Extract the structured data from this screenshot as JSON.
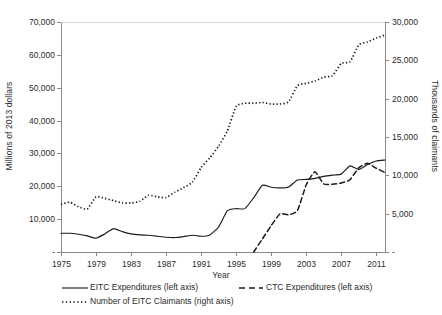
{
  "chart_data": {
    "type": "line",
    "title": "",
    "xlabel": "Year",
    "ylabel": "Millions of 2013 dollars",
    "ylabel_right": "Thousands of claimants",
    "xlim": [
      1975,
      2012
    ],
    "ylim": [
      0,
      70000
    ],
    "ylim_right": [
      0,
      30000
    ],
    "grid": false,
    "legend_position": "below",
    "x_tick_labels": [
      "1975",
      "1979",
      "1983",
      "1987",
      "1991",
      "1995",
      "1999",
      "2003",
      "2007",
      "2011"
    ],
    "x_ticks": [
      1975,
      1979,
      1983,
      1987,
      1991,
      1995,
      1999,
      2003,
      2007,
      2011
    ],
    "y_tick_labels": [
      "-",
      "10,000",
      "20,000",
      "30,000",
      "40,000",
      "50,000",
      "60,000",
      "70,000"
    ],
    "y_ticks": [
      0,
      10000,
      20000,
      30000,
      40000,
      50000,
      60000,
      70000
    ],
    "y_right_tick_labels": [
      "-",
      "5,000",
      "10,000",
      "15,000",
      "20,000",
      "25,000",
      "30,000"
    ],
    "y_right_ticks": [
      0,
      5000,
      10000,
      15000,
      20000,
      25000,
      30000
    ],
    "x": [
      1975,
      1976,
      1977,
      1978,
      1979,
      1980,
      1981,
      1982,
      1983,
      1984,
      1985,
      1986,
      1987,
      1988,
      1989,
      1990,
      1991,
      1992,
      1993,
      1994,
      1995,
      1996,
      1997,
      1998,
      1999,
      2000,
      2001,
      2002,
      2003,
      2004,
      2005,
      2006,
      2007,
      2008,
      2009,
      2010,
      2011,
      2012
    ],
    "series": [
      {
        "name": "EITC Expenditures (left axis)",
        "axis": "left",
        "style": "solid",
        "color": "#1a1a1a",
        "values": [
          5700,
          5700,
          5400,
          4900,
          4200,
          5500,
          7100,
          6200,
          5500,
          5200,
          5100,
          4800,
          4500,
          4400,
          4700,
          5100,
          4800,
          5200,
          7600,
          12600,
          13200,
          13200,
          16500,
          20300,
          19700,
          19500,
          19800,
          21900,
          22100,
          22400,
          23000,
          23400,
          23700,
          26200,
          25100,
          26600,
          27700,
          28000
        ]
      },
      {
        "name": "CTC Expenditures (left axis)",
        "axis": "left",
        "style": "dashed",
        "color": "#1a1a1a",
        "values": [
          null,
          null,
          null,
          null,
          null,
          null,
          null,
          null,
          null,
          null,
          null,
          null,
          null,
          null,
          null,
          null,
          null,
          null,
          null,
          null,
          null,
          null,
          0,
          4000,
          8000,
          11600,
          11300,
          12600,
          20400,
          24400,
          20700,
          20600,
          21000,
          22000,
          25600,
          27000,
          25500,
          24200
        ]
      },
      {
        "name": "Number of EITC Claimants (right axis)",
        "axis": "right",
        "style": "dotted",
        "color": "#1a1a1a",
        "values": [
          6200,
          6500,
          5900,
          5600,
          7200,
          7000,
          6700,
          6400,
          6400,
          6600,
          7400,
          7200,
          7100,
          7800,
          8400,
          9100,
          11000,
          12300,
          13800,
          15800,
          19000,
          19400,
          19400,
          19500,
          19300,
          19300,
          19600,
          21700,
          22000,
          22300,
          22800,
          23000,
          24600,
          24800,
          27000,
          27400,
          27900,
          28300
        ]
      }
    ]
  },
  "axes": {
    "left_label": "Millions of 2013 dollars",
    "right_label": "Thousands of claimants",
    "x_label": "Year"
  },
  "legend": {
    "items": [
      {
        "label": "EITC Expenditures (left axis)",
        "style": "solid"
      },
      {
        "label": "CTC Expenditures (left axis)",
        "style": "dashed"
      },
      {
        "label": "Number of EITC Claimants (right axis)",
        "style": "dotted"
      }
    ]
  }
}
